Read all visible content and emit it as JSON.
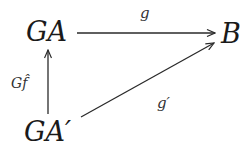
{
  "diagram": {
    "type": "commutative-diagram",
    "nodes": [
      {
        "id": "GA",
        "label": "GA"
      },
      {
        "id": "B",
        "label": "B"
      },
      {
        "id": "GAprime",
        "label": "GA′"
      }
    ],
    "edges": [
      {
        "from": "GA",
        "to": "B",
        "label": "g"
      },
      {
        "from": "GAprime",
        "to": "GA",
        "label": "Gf̂"
      },
      {
        "from": "GAprime",
        "to": "B",
        "label": "g′"
      }
    ],
    "colors": {
      "line": "#2a2a2a",
      "text": "#1a1a1a"
    }
  }
}
